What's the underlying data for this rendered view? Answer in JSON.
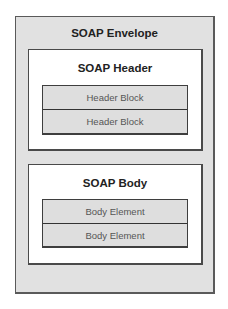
{
  "envelope": {
    "title": "SOAP Envelope",
    "header": {
      "title": "SOAP Header",
      "blocks": [
        "Header Block",
        "Header Block"
      ]
    },
    "body": {
      "title": "SOAP Body",
      "elements": [
        "Body Element",
        "Body Element"
      ]
    }
  }
}
